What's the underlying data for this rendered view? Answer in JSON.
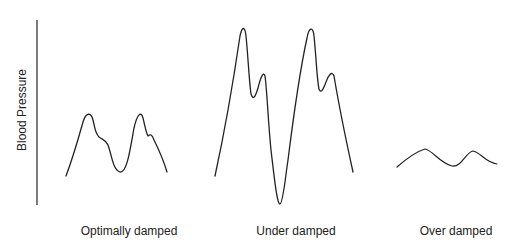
{
  "diagram": {
    "y_axis": {
      "label": "Blood Pressure"
    },
    "panels": [
      {
        "id": "optimal",
        "caption": "Optimally damped"
      },
      {
        "id": "under",
        "caption": "Under damped"
      },
      {
        "id": "over",
        "caption": "Over damped"
      }
    ],
    "colors": {
      "line": "#222222",
      "axis": "#444444",
      "background": "#ffffff"
    }
  }
}
